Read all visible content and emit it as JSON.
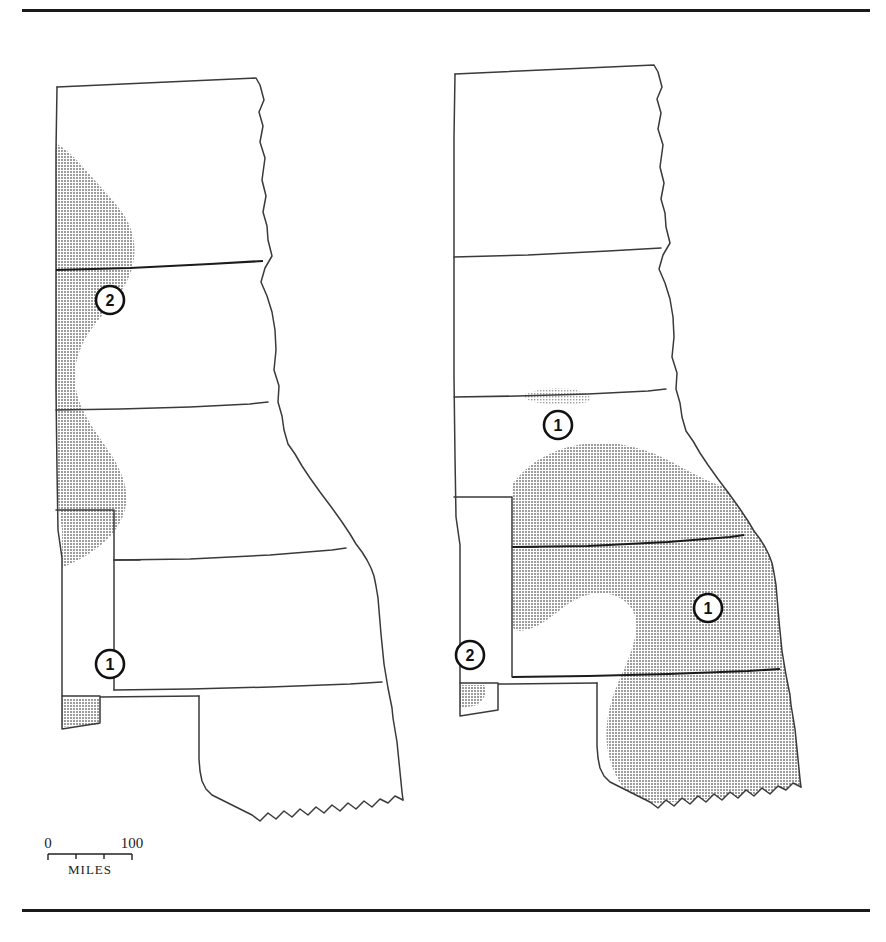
{
  "figure": {
    "type": "thematic-map-pair",
    "region": "Northern and Central Great Plains, United States",
    "states_depicted": [
      "North Dakota",
      "South Dakota",
      "Nebraska",
      "Kansas",
      "Oklahoma"
    ],
    "panel_count": 2
  },
  "rules": {
    "top_label": "top-horizontal-rule",
    "bottom_label": "bottom-horizontal-rule"
  },
  "panels": [
    {
      "id": "left",
      "name": "left-map-panel",
      "shaded_area_description": "Narrow north-south band along the western edge of North Dakota, South Dakota and Nebraska, plus a small patch in the Oklahoma panhandle",
      "markers": [
        {
          "label": "2",
          "name": "marker-2-western-dakotas"
        },
        {
          "label": "1",
          "name": "marker-1-oklahoma-panhandle"
        }
      ]
    },
    {
      "id": "right",
      "name": "right-map-panel",
      "shaded_area_description": "Small patch in north-central Nebraska, a large region covering southern Nebraska, most of Kansas and eastern Oklahoma, and a sliver in the Oklahoma panhandle",
      "markers": [
        {
          "label": "1",
          "name": "marker-1-nebraska"
        },
        {
          "label": "1",
          "name": "marker-1-kansas"
        },
        {
          "label": "2",
          "name": "marker-2-oklahoma-panhandle"
        }
      ]
    }
  ],
  "scale_bar": {
    "name": "scale-bar",
    "min_label": "0",
    "max_label": "100",
    "unit_label": "MILES",
    "tick_count": 4
  },
  "colors": {
    "shade_gray": "#b3b3b3",
    "outline": "#3a3a3a",
    "heavy_border": "#1b1b1b",
    "rule": "#1a1a1a",
    "text": "#222222",
    "background": "#ffffff"
  }
}
